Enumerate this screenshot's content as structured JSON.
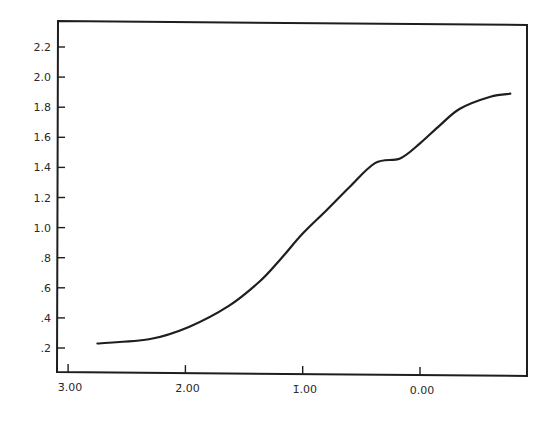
{
  "chart_data": {
    "type": "line",
    "title": "",
    "xlabel": "",
    "ylabel": "",
    "grid": false,
    "legend": null,
    "xlim": [
      -3.1,
      0.9
    ],
    "ylim": [
      0.0,
      2.35
    ],
    "x_ticks": [
      {
        "value": -3,
        "label": "3̄.00"
      },
      {
        "value": -2,
        "label": "2̄.00"
      },
      {
        "value": -1,
        "label": "1̄.00"
      },
      {
        "value": 0,
        "label": "0.00"
      }
    ],
    "y_ticks": [
      {
        "value": 0.2,
        "label": ".2"
      },
      {
        "value": 0.4,
        "label": ".4"
      },
      {
        "value": 0.6,
        "label": ".6"
      },
      {
        "value": 0.8,
        "label": ".8"
      },
      {
        "value": 1.0,
        "label": "1.0"
      },
      {
        "value": 1.2,
        "label": "1.2"
      },
      {
        "value": 1.4,
        "label": "1.4"
      },
      {
        "value": 1.6,
        "label": "1.6"
      },
      {
        "value": 1.8,
        "label": "1.8"
      },
      {
        "value": 2.0,
        "label": "2.0"
      },
      {
        "value": 2.2,
        "label": "2.2"
      }
    ],
    "series": [
      {
        "name": "curve",
        "x": [
          -2.75,
          -2.3,
          -1.97,
          -1.63,
          -1.37,
          -1.2,
          -1.0,
          -0.79,
          -0.6,
          -0.38,
          -0.17,
          0.0,
          0.17,
          0.34,
          0.6,
          0.77
        ],
        "y": [
          0.23,
          0.26,
          0.34,
          0.48,
          0.64,
          0.78,
          0.96,
          1.12,
          1.27,
          1.43,
          1.46,
          1.56,
          1.68,
          1.79,
          1.87,
          1.89
        ]
      }
    ],
    "colors": {
      "line": "#1e1e1e",
      "frame": "#1e1e1e",
      "background": "#ffffff"
    }
  }
}
